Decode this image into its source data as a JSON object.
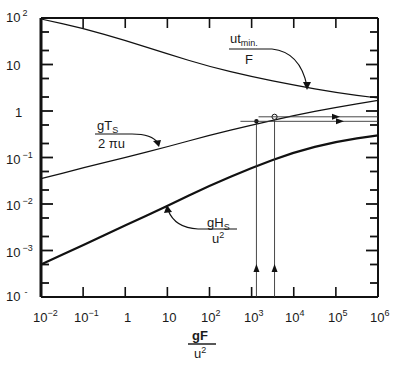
{
  "chart_data": {
    "type": "line",
    "title": "",
    "xlabel": "gF / u^2",
    "ylabel": "",
    "xscale": "log",
    "yscale": "log",
    "xlim": [
      0.01,
      1000000
    ],
    "ylim": [
      0.0001,
      100
    ],
    "grid": false,
    "legend": "inline labels with arrows",
    "x_ticks": [
      "10^-2",
      "10^-1",
      "1",
      "10",
      "10^2",
      "10^3",
      "10^4",
      "10^5",
      "10^6"
    ],
    "y_ticks": [
      "10^-4",
      "10^-3",
      "10^-2",
      "10^-1",
      "1",
      "10",
      "10^2"
    ],
    "series": [
      {
        "name": "ut_min / F",
        "x": [
          0.01,
          0.1,
          1,
          10,
          100,
          1000,
          10000,
          100000,
          1000000
        ],
        "values": [
          95,
          60,
          33,
          17,
          9,
          5.5,
          3.6,
          2.5,
          1.9
        ]
      },
      {
        "name": "gT_s / 2πu",
        "x": [
          0.01,
          0.1,
          1,
          10,
          100,
          1000,
          10000,
          100000,
          1000000
        ],
        "values": [
          0.035,
          0.06,
          0.1,
          0.17,
          0.3,
          0.5,
          0.8,
          1.2,
          1.7
        ]
      },
      {
        "name": "gH_s / u^2",
        "x": [
          0.01,
          0.1,
          1,
          10,
          100,
          1000,
          10000,
          100000,
          1000000
        ],
        "values": [
          0.0005,
          0.0013,
          0.0035,
          0.009,
          0.025,
          0.06,
          0.13,
          0.22,
          0.3
        ]
      }
    ],
    "annotations": [
      {
        "type": "vertical_line",
        "x": 1300,
        "from_y": 0.0001,
        "to_y": 0.6,
        "arrow": "up",
        "marker": "filled-dot"
      },
      {
        "type": "vertical_line",
        "x": 3500,
        "from_y": 0.0001,
        "to_y": 0.75,
        "arrow": "up",
        "marker": "open-circle"
      },
      {
        "type": "horizontal_line",
        "y": 0.6,
        "from_x": 1300,
        "to_x": 1000000,
        "arrow": "right"
      },
      {
        "type": "horizontal_line",
        "y": 0.75,
        "from_x": 3500,
        "to_x": 1000000,
        "arrow": "right"
      }
    ]
  },
  "axes": {
    "x_ticks": [
      {
        "base": "10",
        "exp": "−2"
      },
      {
        "base": "10",
        "exp": "−1"
      },
      {
        "base": "1",
        "exp": ""
      },
      {
        "base": "10",
        "exp": ""
      },
      {
        "base": "10",
        "exp": "2"
      },
      {
        "base": "10",
        "exp": "3"
      },
      {
        "base": "10",
        "exp": "4"
      },
      {
        "base": "10",
        "exp": "5"
      },
      {
        "base": "10",
        "exp": "6"
      }
    ],
    "y_ticks": [
      {
        "base": "10",
        "exp": "2"
      },
      {
        "base": "10",
        "exp": ""
      },
      {
        "base": "1",
        "exp": ""
      },
      {
        "base": "10",
        "exp": "−1"
      },
      {
        "base": "10",
        "exp": "−2"
      },
      {
        "base": "10",
        "exp": "−3"
      },
      {
        "base": "10",
        "exp": "-"
      }
    ],
    "xlabel_num": "gF",
    "xlabel_den": "u2"
  },
  "labels": {
    "tmin_num": "ut",
    "tmin_sub": "min.",
    "tmin_den": "F",
    "ts_num": "gT",
    "ts_sub": "S",
    "ts_den": "2 πu",
    "hs_num": "gH",
    "hs_sub": "S",
    "hs_den": "u",
    "hs_den_sup": "2"
  }
}
